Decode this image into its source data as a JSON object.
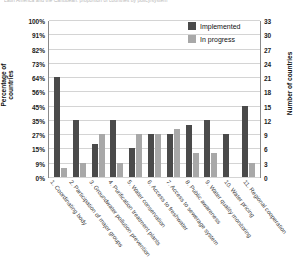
{
  "caption_fragment": "Latin America and the Caribbean: proportion of countries by policy/system",
  "legend": {
    "position": "top-right",
    "entries": [
      {
        "label": "Implemented",
        "color": "#4a4a4a"
      },
      {
        "label": "In progress",
        "color": "#a8a8a8"
      }
    ]
  },
  "axes": {
    "left_title": "Percentage of countries",
    "right_title": "Number of countries",
    "left_ticks": [
      "0%",
      "9%",
      "15%",
      "27%",
      "35%",
      "45%",
      "56%",
      "64%",
      "73%",
      "82%",
      "91%",
      "100%"
    ],
    "right_ticks": [
      "0",
      "3",
      "6",
      "9",
      "12",
      "15",
      "18",
      "21",
      "24",
      "27",
      "30",
      "33"
    ]
  },
  "chart_data": {
    "type": "bar",
    "title": "",
    "xlabel": "",
    "ylabel": "Percentage of countries",
    "y2label": "Number of countries",
    "ylim": [
      0,
      100
    ],
    "y2lim": [
      0,
      33
    ],
    "grid": true,
    "legend_position": "top-right",
    "categories": [
      "1. Coordinating body",
      "2. Participation of major groups",
      "3. Groundwater pollution prevention",
      "4. Purification treatment plants",
      "5. Water conservation",
      "6. Access to freshwater",
      "7. Access to sewerage system",
      "8. Public awareness",
      "9. Water quality monitoring",
      "10. Water pricing",
      "11. Regional cooperation"
    ],
    "series": [
      {
        "name": "Implemented",
        "color": "#4a4a4a",
        "values_pct": [
          64,
          35,
          21,
          36,
          18,
          27,
          27,
          33,
          35,
          27,
          45
        ],
        "values_count": [
          21,
          12,
          7,
          12,
          6,
          9,
          9,
          11,
          12,
          9,
          15
        ]
      },
      {
        "name": "In progress",
        "color": "#a8a8a8",
        "values_pct": [
          6,
          9,
          27,
          9,
          27,
          27,
          30,
          15,
          15,
          0,
          9
        ],
        "values_count": [
          2,
          3,
          9,
          3,
          9,
          9,
          10,
          5,
          5,
          0,
          3
        ]
      }
    ]
  }
}
